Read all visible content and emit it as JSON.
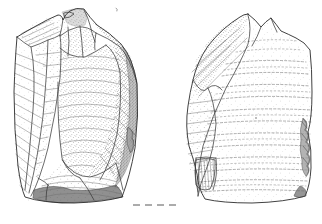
{
  "figure": {
    "background_color": "#ffffff",
    "ink_color": "#2b2b2b",
    "stipple_color": "#555555",
    "shadow_color": "#6b6b6b",
    "canvas": {
      "width": 322,
      "height": 224
    }
  },
  "views": [
    {
      "id": "left-view",
      "name": "dorsal-view",
      "label": "Dorsal face",
      "bounds": {
        "x": 13,
        "y": 6,
        "width": 127,
        "height": 200
      },
      "apex": {
        "x": 85,
        "y": 9
      },
      "features": [
        {
          "name": "platform-remnant",
          "label": "Striking platform remnant"
        },
        {
          "name": "facet-cluster",
          "label": "Small facet cluster"
        },
        {
          "name": "central-flake-scar",
          "label": "Large central flake scar"
        },
        {
          "name": "left-lateral-scar",
          "label": "Left lateral flake scar"
        },
        {
          "name": "right-lateral-scar",
          "label": "Right lateral flake scar"
        },
        {
          "name": "basal-shadow",
          "label": "Shaded basal break"
        },
        {
          "name": "edge-damage",
          "label": "Lateral edge damage"
        }
      ]
    },
    {
      "id": "right-view",
      "name": "ventral-view",
      "label": "Ventral face",
      "bounds": {
        "x": 180,
        "y": 12,
        "width": 134,
        "height": 194
      },
      "apex": {
        "x": 248,
        "y": 14
      },
      "secondary_peak": {
        "x": 272,
        "y": 18
      },
      "features": [
        {
          "name": "bulbar-surface",
          "label": "Bulbar surface with ripple marks"
        },
        {
          "name": "ripple-marks",
          "label": "Concentric ripple lines"
        },
        {
          "name": "retouch-scallops",
          "label": "Scalloped retouch along right edge"
        },
        {
          "name": "basal-notch",
          "label": "Basal notch flake scar"
        },
        {
          "name": "upper-left-facet",
          "label": "Upper left dorsal facet"
        }
      ]
    }
  ],
  "baseline": {
    "name": "section-baseline",
    "label": "Dashed section baseline",
    "y": 205,
    "x_start": 133,
    "x_end": 178,
    "style": "dashed"
  }
}
